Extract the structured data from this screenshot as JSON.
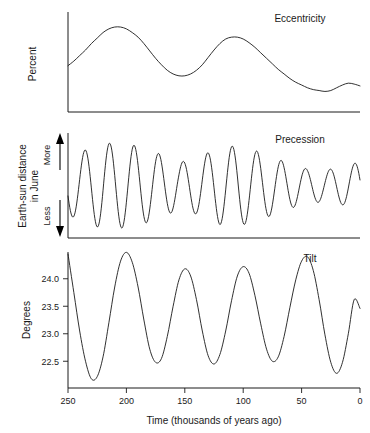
{
  "figure": {
    "title": "",
    "background_color": "#ffffff",
    "line_color": "#1a1a1a"
  },
  "chart_data": [
    {
      "type": "line",
      "title": "Eccentricity",
      "xlabel": "",
      "ylabel": "Percent",
      "xlim": [
        250,
        0
      ],
      "ylim": [
        0,
        1
      ],
      "xticks": [],
      "yticks": [],
      "grid": false,
      "legend": "none",
      "x_axis_reversed": true,
      "series": [
        {
          "name": "Eccentricity",
          "x": [
            250,
            245,
            240,
            235,
            230,
            225,
            220,
            215,
            210,
            205,
            200,
            195,
            190,
            185,
            180,
            175,
            170,
            165,
            160,
            155,
            150,
            145,
            140,
            135,
            130,
            125,
            120,
            115,
            110,
            105,
            100,
            95,
            90,
            85,
            80,
            75,
            70,
            65,
            60,
            55,
            50,
            45,
            40,
            35,
            30,
            25,
            20,
            15,
            10,
            5,
            0
          ],
          "values": [
            0.46,
            0.51,
            0.57,
            0.63,
            0.7,
            0.76,
            0.82,
            0.86,
            0.88,
            0.88,
            0.86,
            0.82,
            0.77,
            0.7,
            0.62,
            0.54,
            0.47,
            0.41,
            0.37,
            0.35,
            0.35,
            0.37,
            0.41,
            0.47,
            0.55,
            0.63,
            0.7,
            0.75,
            0.77,
            0.77,
            0.75,
            0.71,
            0.66,
            0.6,
            0.54,
            0.48,
            0.42,
            0.37,
            0.32,
            0.28,
            0.25,
            0.22,
            0.2,
            0.19,
            0.18,
            0.19,
            0.22,
            0.25,
            0.27,
            0.26,
            0.24
          ]
        }
      ]
    },
    {
      "type": "line",
      "title": "Precession",
      "xlabel": "",
      "ylabel": "Earth-sun distance in June",
      "ylabel_line1": "Earth-sun distance",
      "ylabel_line2": "in June",
      "axis_top_label": "More",
      "axis_bottom_label": "Less",
      "xlim": [
        250,
        0
      ],
      "ylim": [
        -1,
        1
      ],
      "xticks": [],
      "yticks": [],
      "grid": false,
      "legend": "none",
      "x_axis_reversed": true,
      "period_kyr": 21,
      "description": "Quasi-sinusoidal precession signal, amplitude modulated by the eccentricity envelope",
      "series": [
        {
          "name": "Precession",
          "amplitude_envelope_x": [
            250,
            220,
            195,
            175,
            155,
            140,
            120,
            105,
            85,
            65,
            45,
            30,
            15,
            0
          ],
          "amplitude_envelope": [
            0.62,
            0.92,
            0.88,
            0.72,
            0.5,
            0.6,
            0.82,
            0.86,
            0.72,
            0.52,
            0.36,
            0.34,
            0.4,
            0.52
          ],
          "phase_deg": 200
        }
      ]
    },
    {
      "type": "line",
      "title": "Tilt",
      "xlabel": "Time (thousands of years ago)",
      "ylabel": "Degrees",
      "xlim": [
        250,
        0
      ],
      "ylim": [
        22.05,
        24.45
      ],
      "xticks": [
        250,
        200,
        150,
        100,
        50,
        0
      ],
      "xticklabels": [
        "250",
        "200",
        "150",
        "100",
        "50",
        "0"
      ],
      "yticks": [
        22.5,
        23.0,
        23.5,
        24.0
      ],
      "yticklabels": [
        "22.5",
        "23.0",
        "23.5",
        "24.0"
      ],
      "grid": false,
      "legend": "none",
      "x_axis_reversed": true,
      "period_kyr": 41,
      "units": "degrees",
      "series": [
        {
          "name": "Obliquity",
          "x": [
            250,
            245,
            240,
            235,
            230,
            225,
            220,
            215,
            210,
            205,
            200,
            195,
            190,
            185,
            180,
            175,
            170,
            165,
            160,
            155,
            150,
            145,
            140,
            135,
            130,
            125,
            120,
            115,
            110,
            105,
            100,
            95,
            90,
            85,
            80,
            75,
            70,
            65,
            60,
            55,
            50,
            45,
            40,
            35,
            30,
            25,
            20,
            15,
            10,
            5,
            0
          ],
          "values": [
            24.45,
            23.75,
            23.05,
            22.5,
            22.18,
            22.22,
            22.58,
            23.2,
            23.85,
            24.32,
            24.48,
            24.3,
            23.85,
            23.25,
            22.72,
            22.48,
            22.55,
            22.95,
            23.5,
            23.98,
            24.18,
            24.05,
            23.62,
            23.05,
            22.6,
            22.45,
            22.62,
            23.05,
            23.6,
            24.05,
            24.22,
            24.1,
            23.7,
            23.18,
            22.72,
            22.5,
            22.58,
            22.95,
            23.48,
            23.98,
            24.32,
            24.4,
            24.15,
            23.62,
            22.98,
            22.48,
            22.28,
            22.48,
            23.0,
            23.62,
            23.46
          ]
        }
      ]
    }
  ]
}
